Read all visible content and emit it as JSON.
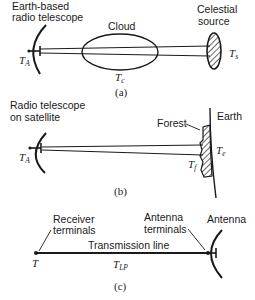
{
  "panel_a": {
    "telescope_label_line1": "Earth-based",
    "telescope_label_line2": "radio telescope",
    "cloud_label": "Cloud",
    "source_label_line1": "Celestial",
    "source_label_line2": "source",
    "antenna_temp": {
      "main": "T",
      "sub": "A"
    },
    "cloud_temp": {
      "main": "T",
      "sub": "c"
    },
    "source_temp": {
      "main": "T",
      "sub": "s"
    },
    "caption": "(a)"
  },
  "panel_b": {
    "telescope_label_line1": "Radio telescope",
    "telescope_label_line2": "on satellite",
    "forest_label": "Forest",
    "earth_label": "Earth",
    "antenna_temp": {
      "main": "T",
      "sub": "A"
    },
    "earth_temp": {
      "main": "T",
      "sub": "e"
    },
    "forest_temp": {
      "main": "T",
      "sub": "f"
    },
    "caption": "(b)"
  },
  "panel_c": {
    "receiver_label_line1": "Receiver",
    "receiver_label_line2": "terminals",
    "antenna_terminals_line1": "Antenna",
    "antenna_terminals_line2": "terminals",
    "antenna_label": "Antenna",
    "line_label": "Transmission line",
    "receiver_temp": {
      "main": "T"
    },
    "line_temp": {
      "main": "T",
      "sub": "LP"
    },
    "caption": "(c)"
  }
}
